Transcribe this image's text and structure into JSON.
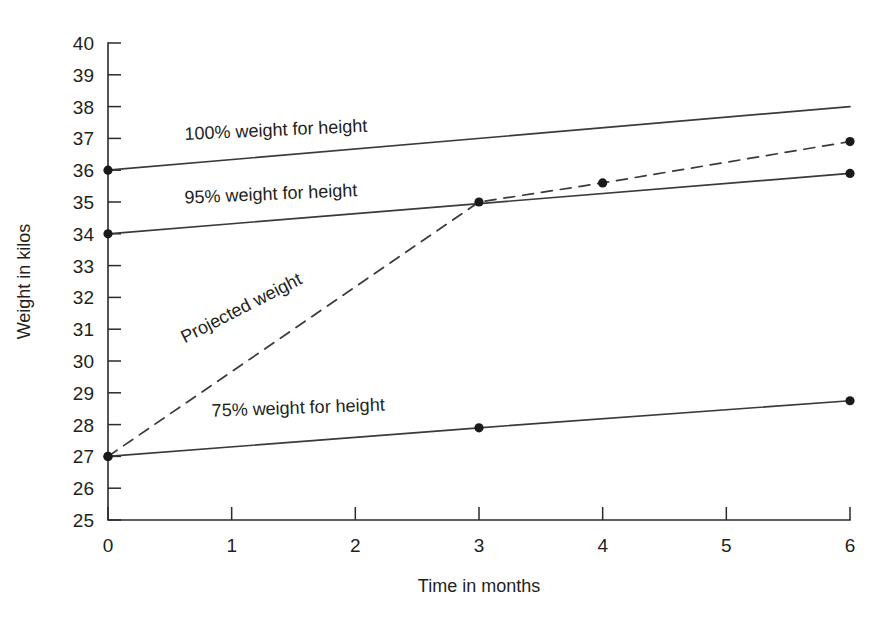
{
  "chart_data": {
    "type": "line",
    "title": "",
    "subtitle": "",
    "xlabel": "Time in months",
    "ylabel": "Weight in kilos",
    "xlim": [
      0,
      6
    ],
    "ylim": [
      25,
      40
    ],
    "grid": false,
    "legend_position": "inline-labels",
    "x_ticks": [
      "0",
      "1",
      "2",
      "3",
      "4",
      "5",
      "6"
    ],
    "x_tick_values": [
      0,
      1,
      2,
      3,
      4,
      5,
      6
    ],
    "y_ticks": [
      "25",
      "26",
      "27",
      "28",
      "29",
      "30",
      "31",
      "32",
      "33",
      "34",
      "35",
      "36",
      "37",
      "38",
      "39",
      "40"
    ],
    "y_tick_values": [
      25,
      26,
      27,
      28,
      29,
      30,
      31,
      32,
      33,
      34,
      35,
      36,
      37,
      38,
      39,
      40
    ],
    "series": [
      {
        "name": "100% weight for height",
        "style": "solid",
        "x": [
          0,
          6
        ],
        "values": [
          36.0,
          38.0
        ],
        "markers": [
          0
        ],
        "label": "100% weight for height",
        "label_x": 0.62,
        "label_y": 36.95,
        "label_rotation": -2.6
      },
      {
        "name": "95% weight for height",
        "style": "solid",
        "x": [
          0,
          6
        ],
        "values": [
          34.0,
          35.9
        ],
        "markers": [
          0,
          6
        ],
        "label": "95% weight for height",
        "label_x": 0.62,
        "label_y": 34.95,
        "label_rotation": -2.5
      },
      {
        "name": "Projected weight",
        "style": "dashed",
        "x": [
          0,
          3,
          4,
          6
        ],
        "values": [
          27.0,
          35.0,
          35.6,
          36.9
        ],
        "markers": [
          0,
          3,
          4,
          6
        ],
        "label": "Projected weight",
        "label_x": 0.62,
        "label_y": 30.55,
        "label_rotation": -27.0
      },
      {
        "name": "75% weight for height",
        "style": "solid",
        "x": [
          0,
          3,
          6
        ],
        "values": [
          27.0,
          27.9,
          28.75
        ],
        "markers": [
          0,
          3,
          6
        ],
        "label": "75% weight for height",
        "label_x": 0.84,
        "label_y": 28.25,
        "label_rotation": -2.0
      }
    ],
    "colors": {
      "line": "#3a3a3a",
      "axis": "#2b2b2b",
      "marker": "#1a1a1a",
      "text": "#231f20",
      "background": "#ffffff"
    }
  }
}
